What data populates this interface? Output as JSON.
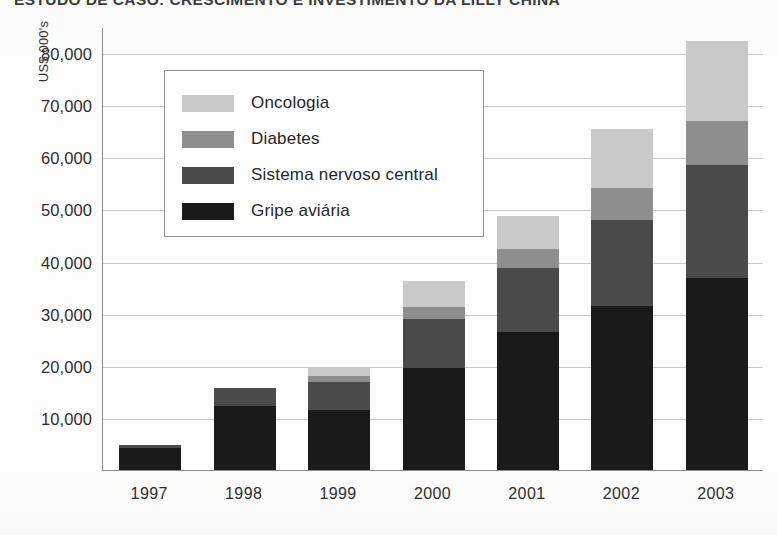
{
  "title": "ESTUDO DE CASO: CRESCIMENTO E INVESTIMENTO DA LILLY CHINA",
  "axes": {
    "y_title": "US$ 000's",
    "y_ticks": [
      "80,000",
      "70,000",
      "60,000",
      "50,000",
      "40,000",
      "30,000",
      "20,000",
      "10,000"
    ],
    "x_ticks": [
      "1997",
      "1998",
      "1999",
      "2000",
      "2001",
      "2002",
      "2003"
    ]
  },
  "legend": {
    "items": [
      {
        "label": "Oncologia",
        "color": "#c9c9c9"
      },
      {
        "label": "Diabetes",
        "color": "#8e8e8e"
      },
      {
        "label": "Sistema nervoso central",
        "color": "#4a4a4a"
      },
      {
        "label": "Gripe aviária",
        "color": "#1a1a1a"
      }
    ]
  },
  "chart_data": {
    "type": "bar",
    "stacked": true,
    "title": "ESTUDO DE CASO: CRESCIMENTO E INVESTIMENTO DA LILLY CHINA",
    "xlabel": "",
    "ylabel": "US$ 000's",
    "ylim": [
      0,
      85000
    ],
    "ytick_values": [
      10000,
      20000,
      30000,
      40000,
      50000,
      60000,
      70000,
      80000
    ],
    "grid": true,
    "legend_position": "inside-upper-left",
    "categories": [
      "1997",
      "1998",
      "1999",
      "2000",
      "2001",
      "2002",
      "2003"
    ],
    "series": [
      {
        "name": "Gripe aviária",
        "color": "#1a1a1a",
        "values": [
          4300,
          12300,
          11500,
          19500,
          26500,
          31500,
          36800
        ]
      },
      {
        "name": "Sistema nervoso central",
        "color": "#4a4a4a",
        "values": [
          500,
          3500,
          5300,
          9500,
          12200,
          16500,
          21800
        ]
      },
      {
        "name": "Diabetes",
        "color": "#8e8e8e",
        "values": [
          0,
          0,
          1300,
          2200,
          3700,
          6200,
          8300
        ]
      },
      {
        "name": "Oncologia",
        "color": "#c9c9c9",
        "values": [
          0,
          0,
          1400,
          5000,
          6400,
          11200,
          15400
        ]
      }
    ],
    "totals": [
      4800,
      15800,
      19500,
      36200,
      48800,
      65400,
      82300
    ]
  }
}
